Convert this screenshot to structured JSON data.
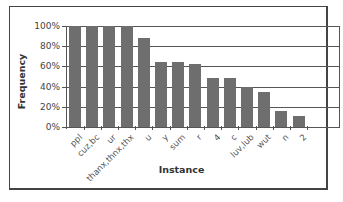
{
  "chart_data": {
    "type": "bar",
    "title": "",
    "xlabel": "Instance",
    "ylabel": "Frequency",
    "ylim": [
      0,
      100
    ],
    "yticks": [
      "0%",
      "20%",
      "40%",
      "60%",
      "80%",
      "100%"
    ],
    "grid": true,
    "legend": null,
    "categories": [
      "ppl",
      "cuz,bc",
      "ur",
      "thanx,thnx,thx",
      "u",
      "y",
      "sum",
      "r",
      "4",
      "c",
      "luv,lub",
      "wut",
      "n",
      "2"
    ],
    "values": [
      100,
      100,
      100,
      100,
      88,
      64,
      64,
      62,
      49,
      49,
      40,
      35,
      16,
      11
    ],
    "bar_color": "#6e6e6e"
  }
}
